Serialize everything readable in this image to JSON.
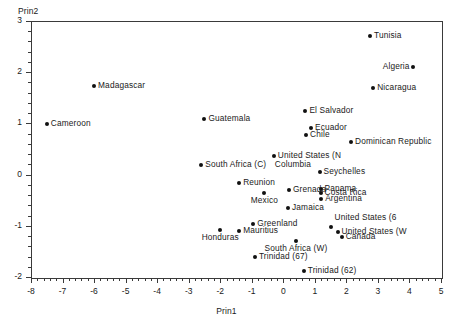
{
  "chart_data": {
    "type": "scatter",
    "title": "",
    "xlabel": "Prin1",
    "ylabel": "Prin2",
    "xlim": [
      -8,
      5
    ],
    "ylim": [
      -2,
      3
    ],
    "xticks": [
      -8,
      -7,
      -6,
      -5,
      -4,
      -3,
      -2,
      -1,
      0,
      1,
      2,
      3,
      4,
      5
    ],
    "yticks": [
      -2,
      -1,
      0,
      1,
      2,
      3
    ],
    "xticklabels": [
      "-8",
      "-7",
      "-6",
      "-5",
      "-4",
      "-3",
      "-2",
      "-1",
      "0",
      "1",
      "2",
      "3",
      "4",
      "5"
    ],
    "yticklabels": [
      "-2",
      "-1",
      "0",
      "1",
      "2",
      "3"
    ],
    "minor_ticks_per_interval": 5,
    "grid": false,
    "legend": null,
    "marker": "filled-circle",
    "marker_color": "#111111",
    "points": [
      {
        "label": "Tunisia",
        "x": 2.75,
        "y": 2.7,
        "anchor": "right"
      },
      {
        "label": "Algeria",
        "x": 4.1,
        "y": 2.1,
        "anchor": "left"
      },
      {
        "label": "Nicaragua",
        "x": 2.85,
        "y": 1.7,
        "anchor": "right"
      },
      {
        "label": "Madagascar",
        "x": -6.0,
        "y": 1.73,
        "anchor": "right"
      },
      {
        "label": "El Salvador",
        "x": 0.7,
        "y": 1.24,
        "anchor": "right"
      },
      {
        "label": "Guatemala",
        "x": -2.5,
        "y": 1.08,
        "anchor": "right"
      },
      {
        "label": "Cameroon",
        "x": -7.5,
        "y": 0.98,
        "anchor": "right"
      },
      {
        "label": "Ecuador",
        "x": 0.88,
        "y": 0.91,
        "anchor": "right"
      },
      {
        "label": "Chile",
        "x": 0.72,
        "y": 0.77,
        "anchor": "right"
      },
      {
        "label": "Dominican Republic",
        "x": 2.15,
        "y": 0.64,
        "anchor": "right"
      },
      {
        "label": "United States (N",
        "x": -0.3,
        "y": 0.36,
        "anchor": "right"
      },
      {
        "label": "Columbia",
        "x": -0.3,
        "y": 0.36,
        "anchor": "below-left"
      },
      {
        "label": "South Africa (C)",
        "x": -2.6,
        "y": 0.18,
        "anchor": "right"
      },
      {
        "label": "Seychelles",
        "x": 1.15,
        "y": 0.05,
        "anchor": "right"
      },
      {
        "label": "Reunion",
        "x": -1.4,
        "y": -0.17,
        "anchor": "right"
      },
      {
        "label": "Panama",
        "x": 1.18,
        "y": -0.28,
        "anchor": "right"
      },
      {
        "label": "Grenada",
        "x": 0.18,
        "y": -0.3,
        "anchor": "right"
      },
      {
        "label": "Mexico",
        "x": -0.6,
        "y": -0.35,
        "anchor": "below"
      },
      {
        "label": "Costa Rica",
        "x": 1.18,
        "y": -0.36,
        "anchor": "right"
      },
      {
        "label": "Argentina",
        "x": 1.2,
        "y": -0.47,
        "anchor": "right"
      },
      {
        "label": "Jamaica",
        "x": 0.15,
        "y": -0.65,
        "anchor": "right"
      },
      {
        "label": "Greenland",
        "x": -0.95,
        "y": -0.97,
        "anchor": "right"
      },
      {
        "label": "United States (6",
        "x": 1.5,
        "y": -1.03,
        "anchor": "above-right"
      },
      {
        "label": "Mauritius",
        "x": -1.4,
        "y": -1.1,
        "anchor": "right"
      },
      {
        "label": "Honduras",
        "x": -2.0,
        "y": -1.08,
        "anchor": "below"
      },
      {
        "label": "United States (W",
        "x": 1.72,
        "y": -1.13,
        "anchor": "right"
      },
      {
        "label": "Canada",
        "x": 1.85,
        "y": -1.21,
        "anchor": "right"
      },
      {
        "label": "South Africa (W)",
        "x": 0.4,
        "y": -1.3,
        "anchor": "below"
      },
      {
        "label": "Trinidad (67)",
        "x": -0.9,
        "y": -1.6,
        "anchor": "right"
      },
      {
        "label": "Trinidad (62)",
        "x": 0.65,
        "y": -1.88,
        "anchor": "right"
      }
    ]
  }
}
